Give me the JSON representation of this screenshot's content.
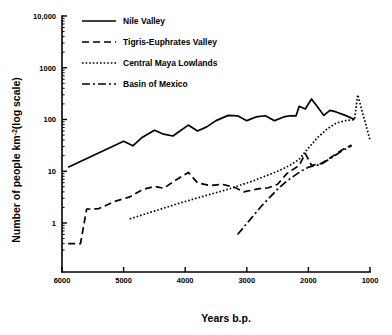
{
  "chart_data": {
    "type": "line",
    "title": "",
    "xlabel": "Years b.p.",
    "ylabel": "Number of people km⁻² (log scale)",
    "ylabel_main": "Number of people km",
    "ylabel_sup": "-2",
    "ylabel_tail": "(log scale)",
    "xlim": [
      6000,
      1000
    ],
    "ylim": [
      0.2,
      10000
    ],
    "yscale": "log",
    "xscale": "linear",
    "x_reversed": true,
    "grid": false,
    "legend_position": "top-left",
    "xticks": [
      6000,
      5000,
      4000,
      3000,
      2000,
      1000
    ],
    "xtick_labels": [
      "6000",
      "5000",
      "4000",
      "3000",
      "2000",
      "1000"
    ],
    "yticks": [
      1,
      10,
      100,
      1000,
      10000
    ],
    "ytick_labels": [
      "1",
      "10",
      "100",
      "1000",
      "10,000"
    ],
    "series": [
      {
        "name": "Nile Valley",
        "style": "solid",
        "dash": "none",
        "width": 1.7,
        "color": "#000000",
        "points": [
          [
            5900,
            12.0
          ],
          [
            5000,
            38.0
          ],
          [
            4850,
            31.0
          ],
          [
            4700,
            45.0
          ],
          [
            4500,
            62.0
          ],
          [
            4350,
            52.0
          ],
          [
            4200,
            48.0
          ],
          [
            3950,
            78.0
          ],
          [
            3800,
            60.0
          ],
          [
            3650,
            72.0
          ],
          [
            3500,
            95.0
          ],
          [
            3300,
            120.0
          ],
          [
            3150,
            118.0
          ],
          [
            3000,
            95.0
          ],
          [
            2850,
            112.0
          ],
          [
            2700,
            118.0
          ],
          [
            2550,
            95.0
          ],
          [
            2400,
            112.0
          ],
          [
            2300,
            118.0
          ],
          [
            2200,
            118.0
          ],
          [
            2150,
            180.0
          ],
          [
            2050,
            160.0
          ],
          [
            1950,
            250.0
          ],
          [
            1850,
            175.0
          ],
          [
            1750,
            120.0
          ],
          [
            1650,
            150.0
          ],
          [
            1550,
            140.0
          ],
          [
            1400,
            120.0
          ],
          [
            1250,
            100.0
          ]
        ]
      },
      {
        "name": "Tigris-Euphrates Valley",
        "style": "dashed",
        "dash": "7,4",
        "width": 1.7,
        "color": "#000000",
        "points": [
          [
            5900,
            0.4
          ],
          [
            5700,
            0.4
          ],
          [
            5600,
            1.85
          ],
          [
            5400,
            1.9
          ],
          [
            5150,
            2.6
          ],
          [
            4900,
            3.2
          ],
          [
            4700,
            4.4
          ],
          [
            4500,
            5.1
          ],
          [
            4350,
            4.7
          ],
          [
            4150,
            6.8
          ],
          [
            3950,
            9.5
          ],
          [
            3800,
            6.0
          ],
          [
            3600,
            5.3
          ],
          [
            3400,
            5.6
          ],
          [
            3200,
            4.9
          ],
          [
            3050,
            4.0
          ],
          [
            2800,
            4.6
          ],
          [
            2650,
            4.8
          ],
          [
            2500,
            5.6
          ],
          [
            2350,
            9.0
          ],
          [
            2150,
            13.0
          ],
          [
            2050,
            22.0
          ],
          [
            1950,
            13.0
          ],
          [
            1800,
            14.0
          ],
          [
            1650,
            18.0
          ],
          [
            1450,
            26.0
          ],
          [
            1300,
            32.0
          ]
        ]
      },
      {
        "name": "Central Maya Lowlands",
        "style": "dotted",
        "dash": "1.6,2.0",
        "width": 1.7,
        "color": "#000000",
        "points": [
          [
            4900,
            1.2
          ],
          [
            4500,
            1.7
          ],
          [
            4100,
            2.4
          ],
          [
            3700,
            3.3
          ],
          [
            3300,
            4.5
          ],
          [
            2900,
            6.5
          ],
          [
            2500,
            10.0
          ],
          [
            2300,
            13.0
          ],
          [
            2150,
            17.0
          ],
          [
            2000,
            28.0
          ],
          [
            1850,
            45.0
          ],
          [
            1700,
            65.0
          ],
          [
            1550,
            85.0
          ],
          [
            1400,
            95.0
          ],
          [
            1250,
            100.0
          ],
          [
            1200,
            300.0
          ],
          [
            1000,
            40.0
          ]
        ]
      },
      {
        "name": "Basin of Mexico",
        "style": "dash-dot",
        "dash": "8,3,2,3",
        "width": 1.7,
        "color": "#000000",
        "points": [
          [
            3150,
            0.6
          ],
          [
            2750,
            2.2
          ],
          [
            2500,
            4.5
          ],
          [
            2350,
            6.5
          ],
          [
            2150,
            9.5
          ],
          [
            2000,
            12.0
          ],
          [
            1800,
            13.5
          ],
          [
            1600,
            19.0
          ],
          [
            1450,
            25.0
          ],
          [
            1300,
            31.0
          ]
        ]
      }
    ]
  },
  "legend": {
    "items": [
      {
        "label": "Nile Valley",
        "style": "solid"
      },
      {
        "label": "Tigris-Euphrates Valley",
        "style": "dashed"
      },
      {
        "label": "Central Maya Lowlands",
        "style": "dotted"
      },
      {
        "label": "Basin of Mexico",
        "style": "dash-dot"
      }
    ]
  }
}
